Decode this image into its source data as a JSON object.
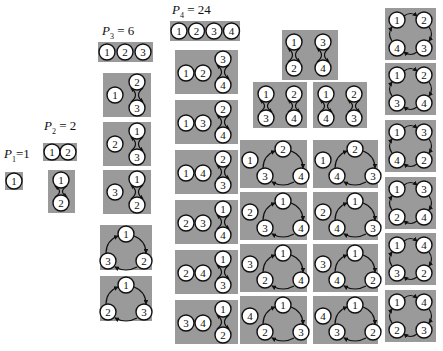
{
  "labels": {
    "p1": {
      "sym": "P",
      "sub": "1",
      "val": "=1"
    },
    "p2": {
      "sym": "P",
      "sub": "2",
      "val": " = 2"
    },
    "p3": {
      "sym": "P",
      "sub": "3",
      "val": " = 6"
    },
    "p4": {
      "sym": "P",
      "sub": "4",
      "val": " = 24"
    }
  },
  "colors": {
    "box": "#9a9a9a",
    "node_fill": "#ffffff",
    "stroke": "#111111"
  },
  "groups": {
    "P1": [
      [
        "1"
      ]
    ],
    "P2": [
      [
        "1",
        "2"
      ],
      [
        "(1 2)"
      ]
    ],
    "P3": [
      [
        "1",
        "2",
        "3"
      ],
      [
        "1",
        "(2 3)"
      ],
      [
        "2",
        "(1 3)"
      ],
      [
        "3",
        "(1 2)"
      ],
      [
        "(1 2 3)"
      ],
      [
        "(1 3 2)"
      ]
    ],
    "P4": [
      [
        "1",
        "2",
        "3",
        "4"
      ],
      [
        "1",
        "2",
        "(3 4)"
      ],
      [
        "1",
        "3",
        "(2 4)"
      ],
      [
        "1",
        "4",
        "(2 3)"
      ],
      [
        "2",
        "3",
        "(1 4)"
      ],
      [
        "2",
        "4",
        "(1 3)"
      ],
      [
        "3",
        "4",
        "(1 2)"
      ],
      [
        "(1 2)(3 4)"
      ],
      [
        "(1 3)(2 4)"
      ],
      [
        "(1 4)(2 3)"
      ],
      [
        "1",
        "(2 3 4)"
      ],
      [
        "1",
        "(2 4 3)"
      ],
      [
        "2",
        "(1 3 4)"
      ],
      [
        "2",
        "(1 4 3)"
      ],
      [
        "3",
        "(1 2 4)"
      ],
      [
        "3",
        "(1 4 2)"
      ],
      [
        "4",
        "(1 2 3)"
      ],
      [
        "4",
        "(1 3 2)"
      ],
      [
        "(1 2 3 4)"
      ],
      [
        "(1 2 4 3)"
      ],
      [
        "(1 3 2 4)"
      ],
      [
        "(1 3 4 2)"
      ],
      [
        "(1 4 2 3)"
      ],
      [
        "(1 4 3 2)"
      ]
    ]
  }
}
